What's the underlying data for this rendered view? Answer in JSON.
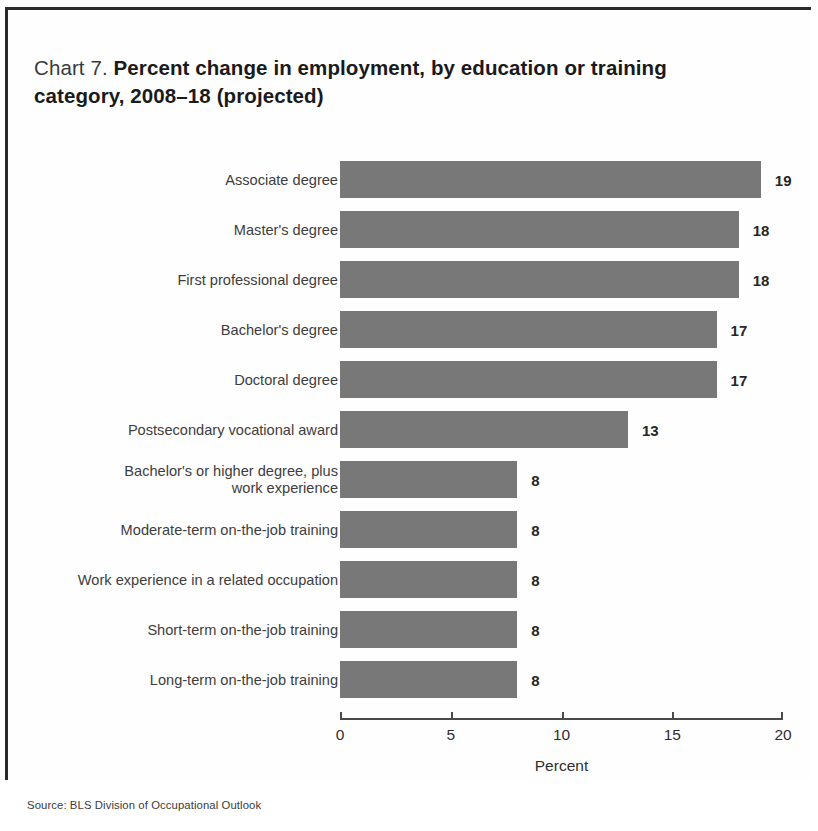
{
  "figure": {
    "title_label": "Chart 7.",
    "title_headline": "Percent change in employment, by education or training category, 2008–18 (projected)",
    "source_note": "Source: BLS Division of Occupational Outlook"
  },
  "chart_data": {
    "type": "bar",
    "orientation": "horizontal",
    "title": "Chart 7. Percent change in employment, by education or training category, 2008–18 (projected)",
    "xlabel": "Percent",
    "ylabel": "",
    "xlim": [
      0,
      20
    ],
    "xticks": [
      0,
      5,
      10,
      15,
      20
    ],
    "xtick_labels": [
      "0",
      "5",
      "10",
      "15",
      "20"
    ],
    "grid": false,
    "legend": false,
    "bar_color": "#787878",
    "value_labels": true,
    "categories": [
      "Associate degree",
      "Master's degree",
      "First professional degree",
      "Bachelor's degree",
      "Doctoral degree",
      "Postsecondary vocational award",
      "Bachelor's or higher degree, plus\nwork experience",
      "Moderate-term on-the-job training",
      "Work experience in a related occupation",
      "Short-term on-the-job training",
      "Long-term on-the-job training"
    ],
    "values": [
      19,
      18,
      18,
      17,
      17,
      13,
      8,
      8,
      8,
      8,
      8
    ],
    "value_label_text": [
      "19",
      "18",
      "18",
      "17",
      "17",
      "13",
      "8",
      "8",
      "8",
      "8",
      "8"
    ]
  }
}
